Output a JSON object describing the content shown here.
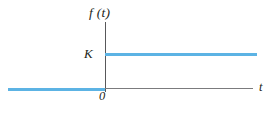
{
  "figure": {
    "name": "unit-step-function-plot",
    "background_color": "#ffffff",
    "curve_color": "#5cb3e4",
    "axis_color": "#58585a",
    "label_color": "#231f20"
  },
  "labels": {
    "function_label": "f (t)",
    "amplitude_label": "K",
    "origin_label": "0",
    "time_axis_label": "t"
  },
  "chart_data": {
    "type": "line",
    "title": "",
    "subtitle": "",
    "xlabel": "t",
    "ylabel": "f (t)",
    "xlim": [
      -6.5,
      10.0
    ],
    "ylim": [
      -0.35,
      1.75
    ],
    "grid": false,
    "legend": null,
    "xticks": [
      0
    ],
    "xticklabels": [
      "0"
    ],
    "yticks": [
      1
    ],
    "yticklabels": [
      "K"
    ],
    "annotations": [
      {
        "text": "f (t)",
        "x": 0,
        "y": 1.75,
        "role": "y-axis-title"
      },
      {
        "text": "K",
        "x": -0.9,
        "y": 1.0,
        "role": "y-tick-label"
      },
      {
        "text": "0",
        "x": -0.3,
        "y": -0.2,
        "role": "origin-label"
      },
      {
        "text": "t",
        "x": 10.0,
        "y": 0.0,
        "role": "x-axis-title"
      }
    ],
    "series": [
      {
        "name": "f (t) = K u(t)",
        "color": "#5cb3e4",
        "linewidth": 3,
        "segments": [
          {
            "name": "pre-step",
            "x": [
              -6.5,
              0
            ],
            "y": [
              0,
              0
            ]
          },
          {
            "name": "post-step",
            "x": [
              0,
              10.2
            ],
            "y": [
              1,
              1
            ]
          }
        ]
      }
    ]
  }
}
